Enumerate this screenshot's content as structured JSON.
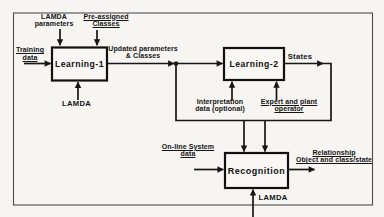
{
  "diagram": {
    "boxes": {
      "learning1": "Learning-1",
      "learning2": "Learning-2",
      "recognition": "Recognition"
    },
    "labels": {
      "lamda_parameters": {
        "line1": "LAMDA",
        "line2": "parameters"
      },
      "pre_assigned_classes": {
        "line1": "Pre-assigned",
        "line2": "Classes"
      },
      "training_data": {
        "line1": "Training",
        "line2": "data"
      },
      "updated_parameters": {
        "line1": "Updated parameters",
        "line2": "& Classes"
      },
      "lamda_learning1": "LAMDA",
      "states": "States",
      "interpretation_data": {
        "line1": "Interpretation",
        "line2": "data (optional)"
      },
      "expert_plant": {
        "line1": "Expert and plant",
        "line2": "operator"
      },
      "online_system_data": {
        "line1": "On-line System",
        "line2": "data"
      },
      "relationship": {
        "line1": "Relationship",
        "line2": "Object and class/state"
      },
      "lamda_recognition": "LAMDA"
    },
    "colors": {
      "line": "#161616",
      "frame": "#4d4d4d",
      "background": "#f6f5f2",
      "text": "#141414"
    }
  }
}
